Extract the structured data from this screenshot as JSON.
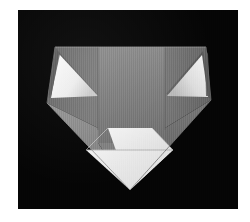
{
  "scene": {
    "title": "Folded paper model photograph",
    "subject": "origami-style folded sheet",
    "background_color": "#050505",
    "matte_color": "#ffffff",
    "frame": {
      "x": 18,
      "y": 10,
      "width": 220,
      "height": 199
    }
  },
  "palette": {
    "background": "#050505",
    "matte": "#ffffff",
    "panel_center": "#7f7f7f",
    "panel_center_light": "#8a8a8a",
    "panel_left": "#6f6f6f",
    "panel_right": "#6a6a6a",
    "panel_lower_left": "#8c8c8c",
    "panel_lower_right": "#7a7a7a",
    "wedge_highlight": "#ededed",
    "wedge_highlight_dim": "#cfcfcf",
    "front_flap_white": "#f4f4f4",
    "front_flap_white_dim": "#e2e2e2",
    "crease_line": "#5e5e5e",
    "edge_shadow": "#3a3a3a"
  },
  "geometry": {
    "viewbox": "0 0 220 199",
    "note": "coordinates are relative to the photo frame interior",
    "paper_outline": [
      [
        37,
        37
      ],
      [
        188,
        37
      ],
      [
        193,
        90
      ],
      [
        112,
        180
      ],
      [
        29,
        93
      ]
    ],
    "top_edge_y": 37,
    "left_vertex": [
      29,
      93
    ],
    "right_vertex": [
      193,
      90
    ],
    "bottom_vertex": [
      112,
      180
    ],
    "crease_left_x": 80,
    "crease_right_x": 147,
    "front_flap": [
      [
        90,
        118
      ],
      [
        134,
        118
      ],
      [
        155,
        140
      ],
      [
        112,
        180
      ],
      [
        68,
        138
      ]
    ],
    "flap_fold_line": [
      [
        69,
        140
      ],
      [
        155,
        140
      ]
    ],
    "left_wedge": [
      [
        39,
        40
      ],
      [
        72,
        79
      ],
      [
        29,
        82
      ]
    ],
    "right_wedge": [
      [
        187,
        40
      ],
      [
        151,
        80
      ],
      [
        193,
        83
      ]
    ]
  },
  "chart_data": {
    "type": "scatter",
    "title": "Folded paper model photograph",
    "categories": [],
    "values": []
  }
}
